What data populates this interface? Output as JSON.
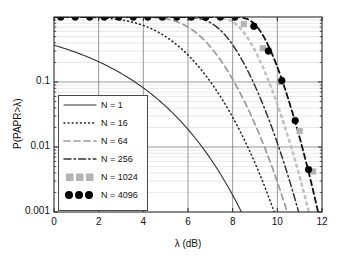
{
  "chart_data": {
    "type": "line",
    "title": "",
    "xlabel": "λ (dB)",
    "ylabel": "P(PAPR>λ)",
    "xlim": [
      0,
      12
    ],
    "ylim": [
      0.001,
      1
    ],
    "yscale": "log",
    "grid": true,
    "minor_grid": true,
    "xticks": [
      "0",
      "2",
      "4",
      "6",
      "8",
      "10",
      "12"
    ],
    "xtick_values": [
      0,
      2,
      4,
      6,
      8,
      10,
      12
    ],
    "yticks": [
      "0.1",
      "0.01",
      "0.001"
    ],
    "ytick_values": [
      0.1,
      0.01,
      0.001
    ],
    "legend_position": "lower left",
    "series": [
      {
        "name": "N = 1",
        "N": 1,
        "style": "solid",
        "color": "#333333",
        "marker": "none",
        "x": [
          0,
          0.5,
          1,
          1.5,
          2,
          2.5,
          3,
          3.5,
          4,
          4.5,
          5,
          5.5,
          6,
          6.5,
          7,
          7.5,
          8,
          8.4
        ],
        "y": [
          0.368,
          0.325,
          0.285,
          0.246,
          0.208,
          0.172,
          0.139,
          0.109,
          0.0821,
          0.0597,
          0.0417,
          0.0279,
          0.0179,
          0.0109,
          0.00633,
          0.00349,
          0.00183,
          0.001
        ]
      },
      {
        "name": "N = 16",
        "N": 16,
        "style": "dotted",
        "color": "#222222",
        "marker": "none",
        "x": [
          0,
          0.5,
          1,
          1.5,
          2,
          2.5,
          3,
          3.5,
          4,
          4.5,
          5,
          5.5,
          6,
          6.5,
          7,
          7.5,
          8,
          8.5,
          9,
          9.5,
          10,
          10.3
        ],
        "y": [
          0.9993,
          0.9985,
          0.9967,
          0.9928,
          0.9845,
          0.9678,
          0.9363,
          0.8808,
          0.7932,
          0.6735,
          0.5296,
          0.3801,
          0.2484,
          0.1497,
          0.0858,
          0.0481,
          0.0267,
          0.0148,
          0.00817,
          0.00451,
          0.00249,
          0.0019
        ]
      },
      {
        "name": "N = 64",
        "N": 64,
        "style": "dashed",
        "color": "#9a9a9a",
        "marker": "none",
        "x": [
          0,
          1,
          2,
          3,
          4,
          4.5,
          5,
          5.5,
          6,
          6.5,
          7,
          7.5,
          8,
          8.5,
          9,
          9.5,
          10,
          10.5,
          11,
          11.2
        ],
        "y": [
          1.0,
          1.0,
          0.99999,
          0.99983,
          0.99819,
          0.99264,
          0.9751,
          0.9274,
          0.8263,
          0.6673,
          0.48,
          0.3113,
          0.1855,
          0.1045,
          0.0569,
          0.0305,
          0.0162,
          0.00855,
          0.00451,
          0.0035
        ]
      },
      {
        "name": "N = 256",
        "N": 256,
        "style": "dashdot",
        "color": "#333333",
        "marker": "none",
        "x": [
          0,
          1,
          2,
          3,
          4,
          5,
          5.5,
          6,
          6.5,
          7,
          7.5,
          8,
          8.5,
          9,
          9.5,
          10,
          10.5,
          11,
          11.5,
          12
        ],
        "y": [
          1.0,
          1.0,
          1.0,
          1.0,
          1.0,
          0.99997,
          0.99972,
          0.99891,
          0.98764,
          0.92768,
          0.7767,
          0.5563,
          0.3482,
          0.2025,
          0.1147,
          0.0632,
          0.034,
          0.018,
          0.00946,
          0.00494
        ]
      },
      {
        "name": "N = 1024",
        "N": 1024,
        "style": "dotted-thick",
        "color": "#c2c2c2",
        "marker": "square",
        "marker_color": "#b4b4b4",
        "marker_x": [
          8.5,
          9.35,
          10.15,
          11.0,
          11.6
        ],
        "marker_y": [
          0.78,
          0.33,
          0.1,
          0.0175,
          0.0042
        ],
        "x": [
          0,
          2,
          4,
          5,
          6,
          6.5,
          7,
          7.5,
          8,
          8.5,
          9,
          9.5,
          10,
          10.5,
          11,
          11.5,
          12
        ],
        "y": [
          1.0,
          1.0,
          1.0,
          1.0,
          1.0,
          1.0,
          0.99997,
          0.99954,
          0.99429,
          0.9572,
          0.8322,
          0.6186,
          0.4002,
          0.2368,
          0.134,
          0.0742,
          0.0403
        ]
      },
      {
        "name": "N = 4096",
        "N": 4096,
        "style": "dashed-thick",
        "color": "#111111",
        "marker": "circle",
        "marker_color": "#000000",
        "marker_x": [
          0.3,
          0.95,
          1.6,
          2.25,
          2.9,
          3.55,
          4.2,
          4.85,
          5.5,
          6.15,
          6.8,
          7.45,
          8.1,
          8.95,
          9.6,
          10.2,
          10.8,
          11.4
        ],
        "marker_y": [
          1.0,
          1.0,
          1.0,
          1.0,
          1.0,
          1.0,
          1.0,
          1.0,
          1.0,
          1.0,
          1.0,
          1.0,
          1.0,
          0.72,
          0.3,
          0.105,
          0.0255,
          0.0045
        ],
        "x": [
          0,
          2,
          4,
          6,
          7,
          7.5,
          8,
          8.5,
          9,
          9.5,
          10,
          10.5,
          11,
          11.5,
          12
        ],
        "y": [
          1.0,
          1.0,
          1.0,
          1.0,
          1.0,
          1.0,
          0.99997,
          0.99872,
          0.97126,
          0.8501,
          0.6329,
          0.4098,
          0.2413,
          0.1349,
          0.0733
        ]
      }
    ]
  },
  "legend": {
    "entries": [
      {
        "label": "N = 1"
      },
      {
        "label": "N = 16"
      },
      {
        "label": "N = 64"
      },
      {
        "label": "N = 256"
      },
      {
        "label": "N = 1024"
      },
      {
        "label": "N = 4096"
      }
    ]
  }
}
